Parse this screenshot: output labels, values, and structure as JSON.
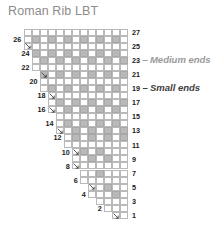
{
  "title": "Roman Rib LBT",
  "annotations": {
    "medium_ends": "Medium ends",
    "small_ends": "Small ends"
  },
  "axis": {
    "right_labels": [
      27,
      25,
      23,
      21,
      19,
      17,
      15,
      13,
      11,
      9,
      7,
      5,
      3,
      1
    ],
    "left_labels": [
      26,
      24,
      22,
      20,
      18,
      16,
      14,
      12,
      10,
      8,
      6,
      4,
      2
    ]
  },
  "chart_data": {
    "type": "heatmap",
    "title": "Roman Rib LBT",
    "xlabel": "",
    "ylabel": "",
    "grid": true,
    "columns": 13,
    "rows": 27,
    "legend_position": "right",
    "legend": [
      "Medium ends",
      "Small ends"
    ],
    "cell_filled_color": "#b9b9b9",
    "cell_empty_color": "#ffffff",
    "row_order": "bottom-to-top",
    "row_numbers_right_odd": [
      27,
      25,
      23,
      21,
      19,
      17,
      15,
      13,
      11,
      9,
      7,
      5,
      3,
      1
    ],
    "row_numbers_left_even": [
      26,
      24,
      22,
      20,
      18,
      16,
      14,
      12,
      10,
      8,
      6,
      4,
      2
    ],
    "rows_data": [
      {
        "row": 27,
        "start_col": 0,
        "filled": []
      },
      {
        "row": 26,
        "start_col": 0,
        "filled": [
          1,
          3,
          5,
          7,
          9,
          11
        ]
      },
      {
        "row": 25,
        "start_col": 0,
        "filled": []
      },
      {
        "row": 24,
        "start_col": 1,
        "filled": [
          1,
          3,
          5,
          7,
          9,
          11
        ]
      },
      {
        "row": 23,
        "start_col": 1,
        "filled": [
          2,
          4,
          6,
          8,
          10,
          12
        ]
      },
      {
        "row": 22,
        "start_col": 1,
        "filled": []
      },
      {
        "row": 21,
        "start_col": 2,
        "filled": [
          2,
          4,
          6,
          8,
          10,
          12
        ]
      },
      {
        "row": 20,
        "start_col": 2,
        "filled": []
      },
      {
        "row": 19,
        "start_col": 2,
        "filled": [
          3,
          5,
          7,
          9,
          11
        ]
      },
      {
        "row": 18,
        "start_col": 3,
        "filled": []
      },
      {
        "row": 17,
        "start_col": 3,
        "filled": [
          4,
          6,
          8,
          10,
          12
        ]
      },
      {
        "row": 16,
        "start_col": 3,
        "filled": [
          5,
          7,
          9,
          11
        ]
      },
      {
        "row": 15,
        "start_col": 4,
        "filled": []
      },
      {
        "row": 14,
        "start_col": 4,
        "filled": [
          5,
          7,
          9,
          11
        ]
      },
      {
        "row": 13,
        "start_col": 4,
        "filled": [
          6,
          8,
          10,
          12
        ]
      },
      {
        "row": 12,
        "start_col": 5,
        "filled": [
          6,
          8,
          10,
          12
        ]
      },
      {
        "row": 11,
        "start_col": 5,
        "filled": []
      },
      {
        "row": 10,
        "start_col": 6,
        "filled": [
          7,
          9
        ]
      },
      {
        "row": 9,
        "start_col": 6,
        "filled": [
          8,
          10
        ]
      },
      {
        "row": 8,
        "start_col": 6,
        "filled": []
      },
      {
        "row": 7,
        "start_col": 7,
        "filled": [
          9
        ]
      },
      {
        "row": 6,
        "start_col": 7,
        "filled": []
      },
      {
        "row": 5,
        "start_col": 8,
        "filled": [
          10
        ]
      },
      {
        "row": 4,
        "start_col": 8,
        "filled": [
          11
        ]
      },
      {
        "row": 3,
        "start_col": 9,
        "filled": []
      },
      {
        "row": 2,
        "start_col": 10,
        "filled": []
      },
      {
        "row": 1,
        "start_col": 11,
        "filled": []
      }
    ],
    "step_tick_rows": [
      25,
      21,
      18,
      16,
      13,
      10,
      8,
      5,
      1
    ]
  }
}
